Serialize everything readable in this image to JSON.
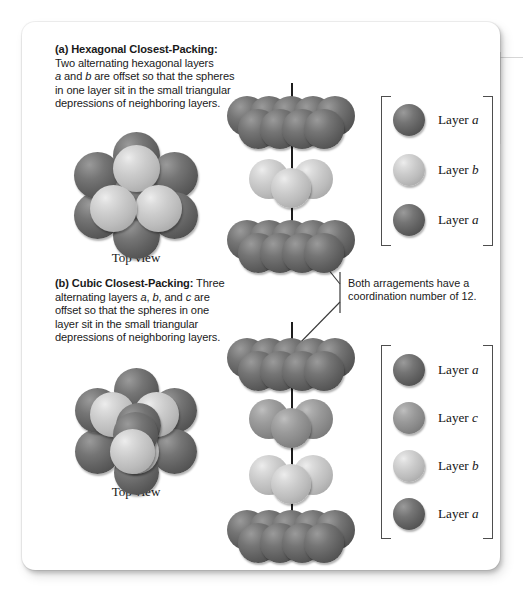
{
  "figure": {
    "panel_a": {
      "label": "(a)",
      "heading": "Hexagonal Closest-Packing:",
      "body_lines": [
        "Two alternating hexagonal layers",
        "a and b are offset so that the spheres",
        "in one layer sit in the small triangular",
        "depressions of neighboring layers."
      ],
      "top_view_label": "Top view"
    },
    "panel_b": {
      "label": "(b)",
      "heading": "Cubic Closest-Packing:",
      "body_lines": [
        "Three",
        "alternating layers a, b, and c are",
        "offset so that the spheres in one",
        "layer sit in the small triangular",
        "depressions of neighboring layers."
      ],
      "top_view_label": "Top view"
    },
    "annotation": {
      "line1": "Both arragements have a",
      "line2": "coordination number of 12.",
      "coordination_number": "12"
    },
    "legend_hcp": {
      "rows": [
        {
          "layer": "a",
          "label_prefix": "Layer ",
          "label": "Layer a",
          "shade": "dark",
          "color": "#636363"
        },
        {
          "layer": "b",
          "label_prefix": "Layer ",
          "label": "Layer b",
          "shade": "light",
          "color": "#c5c5c5"
        },
        {
          "layer": "a",
          "label_prefix": "Layer ",
          "label": "Layer a",
          "shade": "dark",
          "color": "#636363"
        }
      ]
    },
    "legend_ccp": {
      "rows": [
        {
          "layer": "a",
          "label_prefix": "Layer ",
          "label": "Layer a",
          "shade": "dark",
          "color": "#636363"
        },
        {
          "layer": "c",
          "label_prefix": "Layer ",
          "label": "Layer c",
          "shade": "mid",
          "color": "#8a8a8a"
        },
        {
          "layer": "b",
          "label_prefix": "Layer ",
          "label": "Layer b",
          "shade": "light",
          "color": "#c5c5c5"
        },
        {
          "layer": "a",
          "label_prefix": "Layer ",
          "label": "Layer a",
          "shade": "dark",
          "color": "#636363"
        }
      ]
    },
    "stack_hcp": {
      "sequence": [
        "a",
        "b",
        "a"
      ],
      "shades": [
        "dark",
        "light",
        "dark"
      ]
    },
    "stack_ccp": {
      "sequence": [
        "a",
        "c",
        "b",
        "a"
      ],
      "shades": [
        "dark",
        "mid",
        "light",
        "dark"
      ]
    },
    "colors": {
      "sphere_dark": "#636363",
      "sphere_mid": "#8a8a8a",
      "sphere_light": "#c5c5c5",
      "axis": "#1d1d1d",
      "bracket": "#4e4e4e",
      "text": "#1a1a1a",
      "card_background": "#ffffff",
      "page_background": "#ffffff"
    }
  }
}
